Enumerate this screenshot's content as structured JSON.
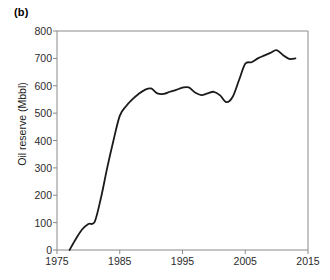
{
  "panel": {
    "label": "(b)"
  },
  "chart_data": {
    "type": "line",
    "title": "",
    "subtitle": "",
    "xlabel": "",
    "ylabel": "Oil reserve (Mbbl)",
    "xlim": [
      1975,
      2015
    ],
    "ylim": [
      0,
      800
    ],
    "grid": false,
    "legend": null,
    "xticks": [
      1975,
      1985,
      1995,
      2005,
      2015
    ],
    "xtick_labels": [
      "1975",
      "1985",
      "1995",
      "2005",
      "2015"
    ],
    "yticks": [
      0,
      100,
      200,
      300,
      400,
      500,
      600,
      700,
      800
    ],
    "ytick_labels": [
      "0",
      "100",
      "200",
      "300",
      "400",
      "500",
      "600",
      "700",
      "800"
    ],
    "line_color": "#1a1a1a",
    "line_width": 1.8,
    "series": [
      {
        "name": "Oil reserve",
        "x": [
          1977,
          1978,
          1979,
          1980,
          1981,
          1982,
          1983,
          1984,
          1985,
          1986,
          1987,
          1988,
          1989,
          1990,
          1991,
          1992,
          1993,
          1994,
          1995,
          1996,
          1997,
          1998,
          1999,
          2000,
          2001,
          2002,
          2003,
          2004,
          2005,
          2006,
          2007,
          2008,
          2009,
          2010,
          2011,
          2012,
          2013
        ],
        "values": [
          0,
          40,
          75,
          95,
          103,
          190,
          300,
          400,
          490,
          525,
          550,
          570,
          585,
          590,
          572,
          570,
          578,
          585,
          593,
          594,
          575,
          566,
          572,
          578,
          565,
          540,
          560,
          620,
          680,
          686,
          700,
          710,
          720,
          730,
          712,
          698,
          700
        ]
      }
    ]
  }
}
